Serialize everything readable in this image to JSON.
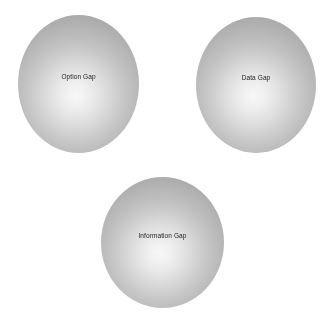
{
  "diagram": {
    "background_color": "#ffffff",
    "shape_type": "sphere",
    "gradient": {
      "highlight_color": "#f7f7f7",
      "mid_color": "#c0c0c0",
      "edge_color": "#a8a8a8",
      "highlight_position": "48% 58%"
    },
    "label_color": "#1a1a1a",
    "nodes": [
      {
        "id": "option-gap",
        "label": "Option Gap",
        "x": 18,
        "y": 15,
        "width": 121,
        "height": 138,
        "label_top": 58
      },
      {
        "id": "data-gap",
        "label": "Data Gap",
        "x": 196,
        "y": 17,
        "width": 120,
        "height": 136,
        "label_top": 57
      },
      {
        "id": "information-gap",
        "label": "Information Gap",
        "x": 101,
        "y": 177,
        "width": 123,
        "height": 131,
        "label_top": 55
      }
    ]
  }
}
